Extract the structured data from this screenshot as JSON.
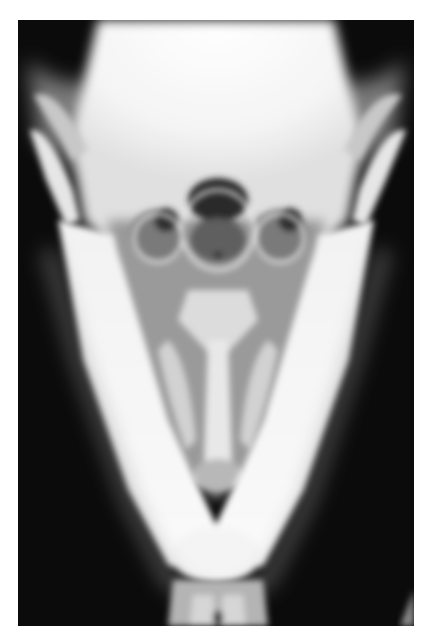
{
  "image": {
    "subject": "radiograph",
    "view": "ventrodorsal skull / mandible x-ray",
    "colors": {
      "background": "#0b0b0b",
      "bone_bright": "#f7f7f7",
      "bone_mid": "#c9c9c9",
      "soft_tissue": "#6a6a6a",
      "page": "#ffffff"
    }
  }
}
